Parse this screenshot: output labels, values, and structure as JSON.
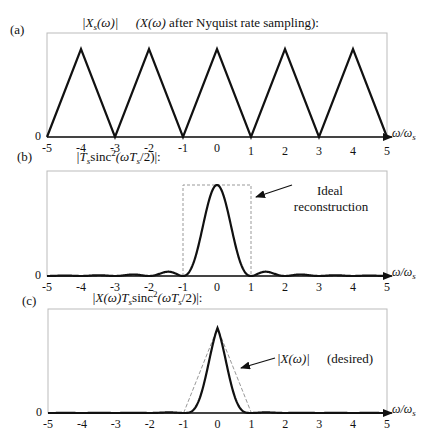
{
  "figure": {
    "panels": [
      {
        "id": "a",
        "label": "(a)",
        "title": "|X_s(ω)|   (X(ω) after Nyquist rate sampling):"
      },
      {
        "id": "b",
        "label": "(b)",
        "title": "|T_s sinc²(ωT_s/2)|:",
        "annotation": [
          "Ideal",
          "reconstruction"
        ]
      },
      {
        "id": "c",
        "label": "(c)",
        "title": "|X(ω)T_s sinc²(ωT_s/2)|:",
        "annotation": [
          "|X(ω)|",
          "(desired)"
        ]
      }
    ],
    "xaxis_label": "ω/ω_s",
    "yzero_label": "0"
  },
  "chart_data": [
    {
      "type": "line",
      "title": "(a) |X_s(ω)| (X(ω) after Nyquist rate sampling)",
      "xlabel": "ω/ω_s",
      "ylabel": "",
      "xlim": [
        -5,
        5
      ],
      "ylim": [
        0,
        1.15
      ],
      "xticks": [
        -5,
        -4,
        -3,
        -2,
        -1,
        0,
        1,
        2,
        3,
        4,
        5
      ],
      "yticks": [
        0
      ],
      "series": [
        {
          "name": "|X_s(ω)|",
          "style": "solid",
          "x": [
            -5,
            -4,
            -3,
            -2,
            -1,
            0,
            1,
            2,
            3,
            4,
            5
          ],
          "y": [
            0,
            1,
            0,
            1,
            0,
            1,
            0,
            1,
            0,
            1,
            0
          ]
        }
      ],
      "grid": false
    },
    {
      "type": "line",
      "title": "(b) |T_s sinc²(ωT_s/2)|",
      "xlabel": "ω/ω_s",
      "ylabel": "",
      "xlim": [
        -5,
        5
      ],
      "ylim": [
        0,
        1.15
      ],
      "xticks": [
        -5,
        -4,
        -3,
        -2,
        -1,
        0,
        1,
        2,
        3,
        4,
        5
      ],
      "yticks": [
        0
      ],
      "series": [
        {
          "name": "T_s sinc²(ωT_s/2)",
          "style": "solid",
          "function": "sinc2",
          "zeros_at": [
            -5,
            -4,
            -3,
            -2,
            -1,
            1,
            2,
            3,
            4,
            5
          ],
          "peak": 1.0
        },
        {
          "name": "Ideal reconstruction",
          "style": "dashed",
          "x": [
            -1,
            -1,
            1,
            1
          ],
          "y": [
            0,
            1,
            1,
            0
          ]
        }
      ],
      "annotations": [
        {
          "text": "Ideal reconstruction",
          "arrow_to": [
            1.1,
            0.82
          ]
        }
      ],
      "grid": false
    },
    {
      "type": "line",
      "title": "(c) |X(ω)T_s sinc²(ωT_s/2)|",
      "xlabel": "ω/ω_s",
      "ylabel": "",
      "xlim": [
        -5,
        5
      ],
      "ylim": [
        0,
        1.15
      ],
      "xticks": [
        -5,
        -4,
        -3,
        -2,
        -1,
        0,
        1,
        2,
        3,
        4,
        5
      ],
      "yticks": [
        0
      ],
      "series": [
        {
          "name": "X(ω)T_s sinc²(ωT_s/2)",
          "style": "solid",
          "function": "tri_x_sinc2",
          "peak": 1.0
        },
        {
          "name": "|X(ω)| (desired)",
          "style": "dashed",
          "x": [
            -1,
            0,
            1
          ],
          "y": [
            0,
            1,
            0
          ]
        }
      ],
      "annotations": [
        {
          "text": "|X(ω)| (desired)",
          "arrow_to": [
            0.65,
            0.35
          ]
        }
      ],
      "grid": false
    }
  ]
}
